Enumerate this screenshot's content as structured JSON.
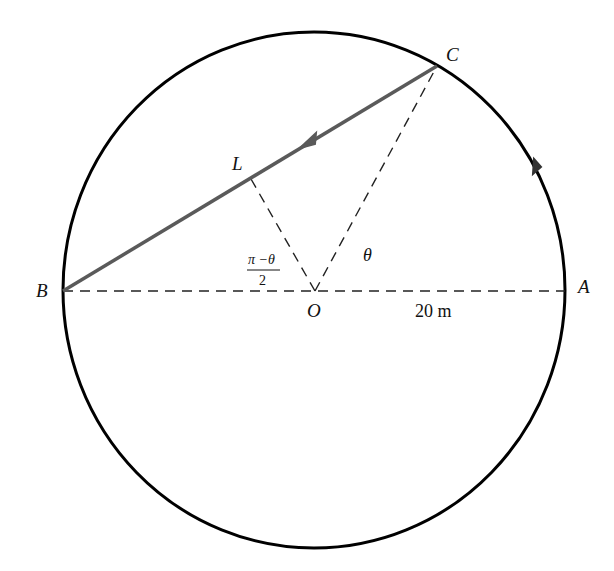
{
  "diagram": {
    "type": "geometry-circle",
    "points": {
      "A": {
        "label": "A"
      },
      "B": {
        "label": "B"
      },
      "C": {
        "label": "C"
      },
      "L": {
        "label": "L"
      },
      "O": {
        "label": "O"
      }
    },
    "angle_labels": {
      "theta": "θ",
      "half_angle_numerator": "π −θ",
      "half_angle_denominator": "2"
    },
    "radius_label": "20 m",
    "colors": {
      "circle": "#000000",
      "chord": "#5a5a5a",
      "dashed": "#222222"
    }
  }
}
